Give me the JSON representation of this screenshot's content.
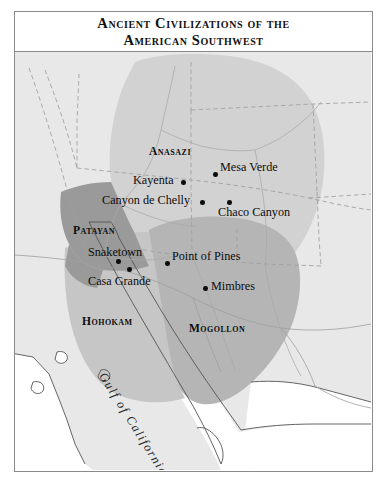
{
  "title": {
    "line1": "Ancient Civilizations of the",
    "line2": "American Southwest"
  },
  "map": {
    "cultures": [
      {
        "name": "Anasazi",
        "label": "Anasazi",
        "x": 134,
        "y": 93,
        "shade": "#d2d2d2"
      },
      {
        "name": "Patayan",
        "label": "Patayan",
        "x": 58,
        "y": 172,
        "shade": "#9a9a9a"
      },
      {
        "name": "Hohokam",
        "label": "Hohokam",
        "x": 67,
        "y": 263,
        "shade": "#c6c6c6"
      },
      {
        "name": "Mogollon",
        "label": "Mogollon",
        "x": 174,
        "y": 270,
        "shade": "#b5b5b5"
      }
    ],
    "sites": [
      {
        "name": "Mesa Verde",
        "label": "Mesa Verde",
        "dot_x": 198,
        "dot_y": 120,
        "label_x": 205,
        "label_y": 108
      },
      {
        "name": "Kayenta",
        "label": "Kayenta",
        "dot_x": 166,
        "dot_y": 128,
        "label_x": 118,
        "label_y": 121
      },
      {
        "name": "Canyon de Chelly",
        "label": "Canyon de Chelly",
        "dot_x": 185,
        "dot_y": 148,
        "label_x": 87,
        "label_y": 141
      },
      {
        "name": "Chaco Canyon",
        "label": "Chaco Canyon",
        "dot_x": 212,
        "dot_y": 148,
        "label_x": 203,
        "label_y": 153
      },
      {
        "name": "Snaketown",
        "label": "Snaketown",
        "dot_x": 101,
        "dot_y": 207,
        "label_x": 73,
        "label_y": 193
      },
      {
        "name": "Point of Pines",
        "label": "Point of Pines",
        "dot_x": 150,
        "dot_y": 209,
        "label_x": 157,
        "label_y": 197
      },
      {
        "name": "Casa Grande",
        "label": "Casa Grande",
        "dot_x": 112,
        "dot_y": 215,
        "label_x": 73,
        "label_y": 222
      },
      {
        "name": "Mimbres",
        "label": "Mimbres",
        "dot_x": 188,
        "dot_y": 234,
        "label_x": 196,
        "label_y": 227
      }
    ],
    "water_labels": [
      {
        "name": "gulf-of-california",
        "text": "Gulf of California",
        "x": 93,
        "y": 318,
        "rotation": 58
      }
    ],
    "colors": {
      "frame": "#8a8a8a",
      "land": "#e8e8e8",
      "water": "#ffffff",
      "coastline": "#555555",
      "state_border": "#9e9e9e",
      "river": "#a8a8a8",
      "anasazi_shade": "#d2d2d2",
      "patayan_shade": "#9a9a9a",
      "hohokam_shade": "#c6c6c6",
      "mogollon_shade": "#b5b5b5",
      "site_dot": "#0d0d0d",
      "text": "#0d0d0d"
    }
  }
}
